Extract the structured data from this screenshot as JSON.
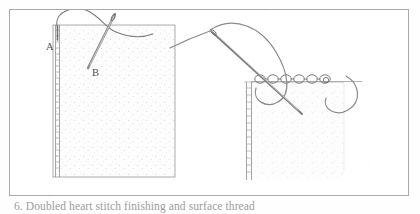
{
  "page": {
    "background_color": "#fefefe",
    "frame_color": "#a9a9a9"
  },
  "caption": {
    "text": "6. Doubled heart stitch finishing and surface thread"
  },
  "figure": {
    "ink_color": "#6b6b6b",
    "fabric_fill": "#fbfbfb",
    "fabric_edge_color": "#9a9a9a",
    "stipple_color": "#cfcfcf",
    "panels": [
      {
        "name": "left-fabric-panel",
        "description": "vertical fabric panel with hemmed left edge",
        "x": 52,
        "y": 24,
        "width": 122,
        "height": 152
      },
      {
        "name": "right-fabric-panel",
        "description": "fabric panel with hemmed left edge and chain-stitched top edge",
        "x": 243,
        "y": 80,
        "width": 100,
        "height": 98
      }
    ],
    "labels": [
      {
        "name": "label-a",
        "text": "A",
        "x": 56,
        "y": 45
      },
      {
        "name": "label-b",
        "text": "B",
        "x": 100,
        "y": 60
      }
    ],
    "left_diagram": {
      "name": "left-stitch-diagram",
      "needle_label": "needle",
      "thread_label": "working thread loop",
      "edge_label": "hemmed edge"
    },
    "right_diagram": {
      "name": "right-stitch-diagram",
      "needle_label": "needle",
      "thread_label": "looped working thread",
      "chain_label": "chain of knotted stitches",
      "chain_loop_count": 6
    }
  }
}
